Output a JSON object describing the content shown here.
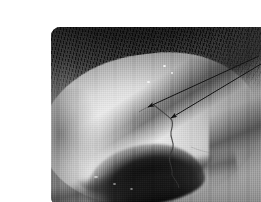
{
  "figure": {
    "kind": "clinical-photograph",
    "alt_text": "Grayscale clinical close-up photograph of an eye showing the bulbar conjunctiva and sclera, with two thin black arrows pointing to an abnormal conjunctival vessel",
    "background_color": "#ffffff",
    "photo": {
      "x": 11,
      "y": 11,
      "width": 239,
      "height": 179,
      "corner_radius": 9,
      "color_mode": "grayscale",
      "texture": "vertical analog scan lines"
    },
    "tones": {
      "sclera_highlight": "#f7f7f7",
      "sclera_midtone": "#dddddd",
      "skin_midtone": "#9a9a9a",
      "skin_shadow": "#6d6d6d",
      "lash_black": "#0a0a0a",
      "pupil_black": "#060606",
      "annotation_black": "#111111"
    },
    "anatomy": [
      {
        "name": "upper-eyelid",
        "label": "Upper eyelid with lashes"
      },
      {
        "name": "eyelashes",
        "label": "Eyelashes"
      },
      {
        "name": "sclera",
        "label": "Sclera"
      },
      {
        "name": "bulbar-conjunctiva",
        "label": "Bulbar conjunctiva"
      },
      {
        "name": "iris-pupil",
        "label": "Iris and pupil"
      },
      {
        "name": "lower-eyelid",
        "label": "Lower eyelid margin"
      },
      {
        "name": "lateral-canthus",
        "label": "Lateral canthus"
      },
      {
        "name": "medial-canthus",
        "label": "Medial canthus"
      }
    ],
    "annotations": {
      "count": 2,
      "style": "thin solid black line with filled triangular arrowhead",
      "arrows": [
        {
          "name": "arrow-upper",
          "label": "",
          "tail": {
            "x": 219,
            "y": 40
          },
          "tip": {
            "x": 106,
            "y": 90
          },
          "points_at": "conjunctival vessel, upper segment"
        },
        {
          "name": "arrow-lower",
          "label": "",
          "tail": {
            "x": 226,
            "y": 45
          },
          "tip": {
            "x": 129,
            "y": 101
          },
          "points_at": "conjunctival vessel, lower segment"
        }
      ],
      "target_feature": {
        "name": "conjunctival-vessel",
        "label": "Abnormal conjunctival vessel",
        "description": "dark, irregular, tortuous vessel descending across the sclera"
      }
    },
    "captions": [],
    "labels": [],
    "text_overlays": []
  }
}
